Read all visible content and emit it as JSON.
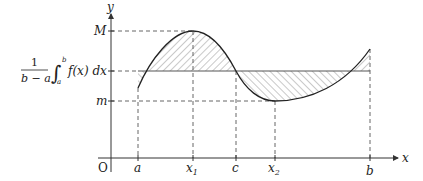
{
  "diagram": {
    "axes": {
      "x_label": "x",
      "y_label": "y",
      "origin_label": "O"
    },
    "x_ticks": [
      {
        "label": "a",
        "sub": ""
      },
      {
        "label": "x",
        "sub": "1"
      },
      {
        "label": "c",
        "sub": ""
      },
      {
        "label": "x",
        "sub": "2"
      },
      {
        "label": "b",
        "sub": ""
      }
    ],
    "y_ticks": {
      "max_label": "M",
      "min_label": "m"
    },
    "mean_value_label": {
      "fraction_numerator": "1",
      "fraction_denominator": "b − a",
      "integral_upper": "b",
      "integral_lower": "a",
      "integrand": "f(x) dx"
    },
    "colors": {
      "axis": "#333333",
      "curve": "#222222",
      "dashed": "#555555",
      "hatch": "#777777"
    }
  }
}
